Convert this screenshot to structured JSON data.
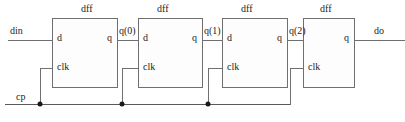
{
  "diagram": {
    "type": "digital-logic-schematic",
    "colors": {
      "wire": "#6f6f6f",
      "bus": "#5a5a5a",
      "junction": "#1a1a1a",
      "box_border": "#6f6f6f",
      "background": "#ffffff",
      "text": "#1c1c1c"
    },
    "blocks": [
      {
        "title": "dff",
        "d_label": "d",
        "q_label": "q",
        "clk_label": "clk"
      },
      {
        "title": "dff",
        "d_label": "d",
        "q_label": "q",
        "clk_label": "clk"
      },
      {
        "title": "dff",
        "d_label": "d",
        "q_label": "q",
        "clk_label": "clk"
      },
      {
        "title": "dff",
        "d_label": "",
        "q_label": "q",
        "clk_label": "clk"
      }
    ],
    "nets": {
      "input": "din",
      "clock": "cp",
      "stage0": "q(0)",
      "stage1": "q(1)",
      "stage2": "q(2)",
      "output": "do"
    }
  }
}
